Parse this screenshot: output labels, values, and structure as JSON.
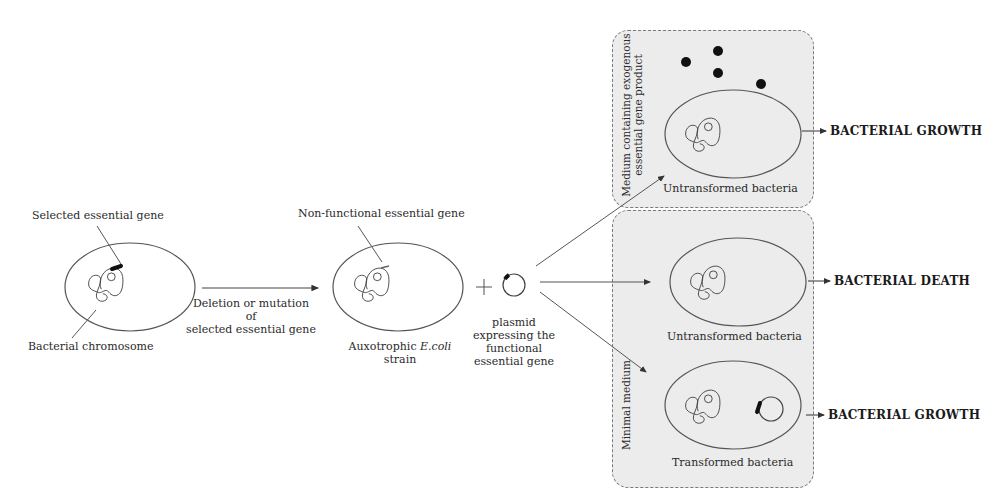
{
  "diagram": {
    "type": "flow-schematic"
  },
  "stage1": {
    "label_gene": "Selected essential gene",
    "label_chromosome": "Bacterial chromosome"
  },
  "arrow1": {
    "line1": "Deletion or mutation of",
    "line2": "selected essential gene"
  },
  "stage2": {
    "label_gene": "Non-functional essential gene",
    "caption_prefix": "Auxotrophic ",
    "caption_italic": "E.coli",
    "caption_line2": "strain"
  },
  "plus_sign": "+",
  "plasmid": {
    "line1": "plasmid",
    "line2": "expressing the",
    "line3": "functional",
    "line4": "essential gene"
  },
  "panels": {
    "top": {
      "medium_line1": "Medium containing exogenous",
      "medium_line2": "essential gene product",
      "cell_label": "Untransformed bacteria",
      "outcome": "BACTERIAL GROWTH"
    },
    "bottom": {
      "medium_label": "Minimal medium",
      "cell1_label": "Untransformed bacteria",
      "cell1_outcome": "BACTERIAL DEATH",
      "cell2_label": "Transformed bacteria",
      "cell2_outcome": "BACTERIAL GROWTH"
    }
  },
  "colors": {
    "panel_fill": "#ececec",
    "panel_border": "#7a7a7a",
    "line": "#555555",
    "gene_mark": "#111111"
  }
}
